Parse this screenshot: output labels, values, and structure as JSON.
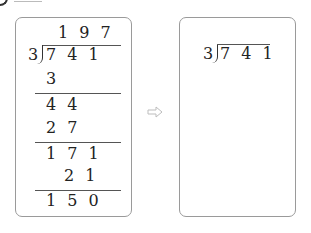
{
  "problem": {
    "answer_blank": ""
  },
  "left_box": {
    "label": "worked-division",
    "quotient": "1 9 7",
    "divisor": "3",
    "dividend": "7 4 1",
    "steps": [
      {
        "value": "3",
        "role": "subtract"
      },
      {
        "value": "4 4",
        "role": "remainder"
      },
      {
        "value": "2 7",
        "role": "subtract"
      },
      {
        "value": "1 7 1",
        "role": "remainder"
      },
      {
        "value": "2 1",
        "role": "subtract"
      },
      {
        "value": "1 5 0",
        "role": "remainder"
      }
    ]
  },
  "arrow": {
    "icon": "right-arrow-icon",
    "color": "#bdbdbd"
  },
  "right_box": {
    "label": "blank-division",
    "divisor": "3",
    "dividend": "7 4 1"
  },
  "colors": {
    "box_border": "#9a9a9a",
    "text": "#222222",
    "rule": "#555555"
  }
}
